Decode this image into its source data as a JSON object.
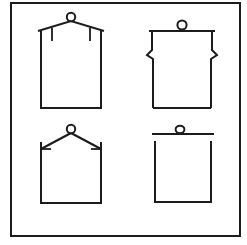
{
  "sheet": {
    "title": "Four-panel technical line drawing",
    "background_color": "#ffffff",
    "stroke_color": "#1c1c1c",
    "width": 247,
    "height": 245,
    "frame": {
      "name": "outer-border",
      "x": 11,
      "y": 3,
      "width": 229,
      "height": 233,
      "stroke_width": 2
    }
  },
  "panels": [
    {
      "id": "panel-top-left",
      "position": "top-left",
      "description": "Box with low-peaked gable roof, circular knob at the roof apex, and two short vertical drop ticks beneath the eaves",
      "label": "",
      "elements": {
        "body_left_x": 41,
        "body_right_x": 101,
        "body_top_y": 34,
        "body_bottom_y": 108,
        "roof_apex_x": 71,
        "roof_apex_y": 22,
        "eave_left_x": 38,
        "eave_right_x": 104,
        "eave_y": 31,
        "knob_cx": 71,
        "knob_cy": 17,
        "knob_r": 4.2,
        "tick_left_x": 52,
        "tick_right_x": 90,
        "tick_top_y": 31,
        "tick_bottom_y": 41
      }
    },
    {
      "id": "panel-top-right",
      "position": "top-right",
      "description": "Box with flat top rail, circular knob resting on the rail centre, and mirrored zigzag pleat notches at both upper corners",
      "label": "",
      "elements": {
        "body_left_x": 152,
        "body_right_x": 212,
        "body_top_y": 31,
        "body_bottom_y": 108,
        "rail_left_x": 149,
        "rail_right_x": 215,
        "rail_y": 31,
        "knob_cx": 182,
        "knob_cy": 24,
        "knob_r": 4.6,
        "notch_y_start": 31,
        "notch_y_end": 56,
        "notch_depth": 5
      }
    },
    {
      "id": "panel-bottom-left",
      "position": "bottom-left",
      "description": "Open-top box with two straight stay lines rising to a circular knob at the apex, with short inward horizontal ticks at the stay anchors",
      "label": "",
      "elements": {
        "body_left_x": 41,
        "body_right_x": 101,
        "body_top_y": 148,
        "body_bottom_y": 203,
        "apex_x": 71,
        "apex_y": 134,
        "knob_cx": 71,
        "knob_cy": 130,
        "knob_r": 4.2,
        "stay_left_anchor_x": 41,
        "stay_right_anchor_x": 101,
        "stay_anchor_y": 148,
        "tick_length": 9,
        "post_top_y": 142
      }
    },
    {
      "id": "panel-bottom-right",
      "position": "bottom-right",
      "description": "Open-top box with a separate wide horizontal bar above it and a small oval knob seated on the bar centre",
      "label": "",
      "elements": {
        "body_left_x": 154,
        "body_right_x": 212,
        "body_top_y": 141,
        "body_bottom_y": 202,
        "bar_left_x": 152,
        "bar_right_x": 214,
        "bar_y": 133,
        "knob_cx": 180,
        "knob_cy": 129,
        "knob_rx": 4.4,
        "knob_ry": 3.6
      }
    }
  ],
  "legend": {
    "visible": false,
    "items": []
  }
}
